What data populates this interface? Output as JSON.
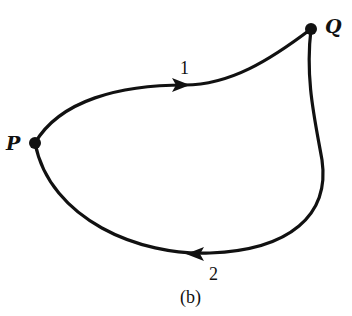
{
  "diagram": {
    "caption": "(b)",
    "points": [
      {
        "id": "P",
        "label": "P",
        "x": 35,
        "y": 143
      },
      {
        "id": "Q",
        "label": "Q",
        "x": 311,
        "y": 29
      }
    ],
    "paths": [
      {
        "id": "1",
        "label": "1",
        "from": "P",
        "to": "Q",
        "direction": "P to Q (upper path, arrow pointing right)"
      },
      {
        "id": "2",
        "label": "2",
        "from": "Q",
        "to": "P",
        "direction": "Q to P (lower path, arrow pointing left)"
      }
    ],
    "colors": {
      "stroke": "#111111",
      "background": "#ffffff"
    }
  }
}
